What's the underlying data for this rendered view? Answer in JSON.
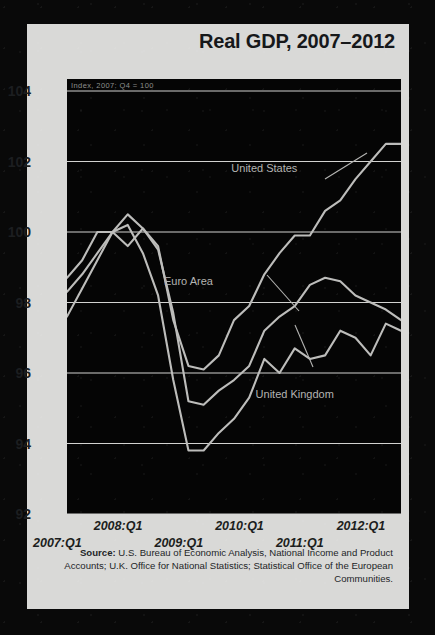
{
  "title": "Real GDP, 2007–2012",
  "subtitle": "Index, 2007: Q4 = 100",
  "source_label": "Source:",
  "source_text": " U.S. Bureau of Economic Analysis, National Income and Product Accounts; U.K. Office for National Statistics; Statistical Office of the European Communities.",
  "colors": {
    "card": "#d9d9d7",
    "plot_background": "#050505",
    "gridline": "#d2d2d0",
    "series_line": "#bdbdbb",
    "title_text": "#16181a",
    "subtitle_text": "#8d8f8d",
    "annotation_text": "#b4b4b2"
  },
  "chart_data": {
    "type": "line",
    "title": "Real GDP, 2007–2012",
    "subtitle": "Index, 2007: Q4 = 100",
    "xlabel": "",
    "ylabel": "Index, 2007: Q4 = 100",
    "ylim": [
      92,
      104
    ],
    "yticks": [
      92,
      94,
      96,
      98,
      100,
      102,
      104
    ],
    "xticks": [
      "2007:Q1",
      "2008:Q1",
      "2009:Q1",
      "2010:Q1",
      "2011:Q1",
      "2012:Q1"
    ],
    "xtick_positions": [
      0,
      4,
      8,
      12,
      16,
      20
    ],
    "grid": true,
    "legend": "inline-annotations",
    "x": [
      "2007:Q1",
      "2007:Q2",
      "2007:Q3",
      "2007:Q4",
      "2008:Q1",
      "2008:Q2",
      "2008:Q3",
      "2008:Q4",
      "2009:Q1",
      "2009:Q2",
      "2009:Q3",
      "2009:Q4",
      "2010:Q1",
      "2010:Q2",
      "2010:Q3",
      "2010:Q4",
      "2011:Q1",
      "2011:Q2",
      "2011:Q3",
      "2011:Q4",
      "2012:Q1",
      "2012:Q2",
      "2012:Q3"
    ],
    "series": [
      {
        "name": "United States",
        "values": [
          98.7,
          99.2,
          100.0,
          100.0,
          99.6,
          100.1,
          99.6,
          97.5,
          96.2,
          96.1,
          96.5,
          97.5,
          97.9,
          98.8,
          99.4,
          99.9,
          99.9,
          100.6,
          100.9,
          101.5,
          102.0,
          102.5,
          102.5
        ]
      },
      {
        "name": "Euro Area",
        "values": [
          98.3,
          98.8,
          99.4,
          100.0,
          100.5,
          100.1,
          99.5,
          97.7,
          95.2,
          95.1,
          95.5,
          95.8,
          96.2,
          97.2,
          97.6,
          97.9,
          98.5,
          98.7,
          98.6,
          98.2,
          98.0,
          97.8,
          97.5
        ]
      },
      {
        "name": "United Kingdom",
        "values": [
          97.6,
          98.4,
          99.2,
          100.0,
          100.2,
          99.4,
          98.2,
          95.8,
          93.8,
          93.8,
          94.3,
          94.7,
          95.3,
          96.4,
          96.0,
          96.7,
          96.4,
          96.5,
          97.2,
          97.0,
          96.5,
          97.4,
          97.2
        ]
      }
    ],
    "annotations": [
      {
        "text": "United States",
        "x_index": 13,
        "y_value": 101.7
      },
      {
        "text": "Euro Area",
        "x_index": 8,
        "y_value": 98.5
      },
      {
        "text": "United Kingdom",
        "x_index": 15,
        "y_value": 95.3
      }
    ]
  }
}
